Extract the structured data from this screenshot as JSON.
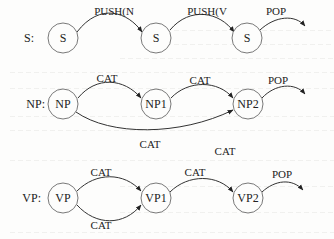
{
  "networks": [
    {
      "id": "S",
      "row_label": "S:",
      "nodes": [
        "S",
        "S",
        "S"
      ],
      "arcs": [
        {
          "from": 0,
          "to": 1,
          "label": "PUSH(N"
        },
        {
          "from": 1,
          "to": 2,
          "label": "PUSH(V"
        },
        {
          "from": 2,
          "to": "exit",
          "label": "POP"
        }
      ]
    },
    {
      "id": "NP",
      "row_label": "NP:",
      "nodes": [
        "NP",
        "NP1",
        "NP2"
      ],
      "arcs": [
        {
          "from": 0,
          "to": 1,
          "label": "CAT"
        },
        {
          "from": 1,
          "to": 2,
          "label": "CAT"
        },
        {
          "from": 2,
          "to": "exit",
          "label": "POP"
        },
        {
          "from": 0,
          "to": 2,
          "label": "CAT"
        }
      ],
      "extra_labels": [
        "CAT"
      ]
    },
    {
      "id": "VP",
      "row_label": "VP:",
      "nodes": [
        "VP",
        "VP1",
        "VP2"
      ],
      "arcs": [
        {
          "from": 0,
          "to": 1,
          "label": "CAT"
        },
        {
          "from": 0,
          "to": 1,
          "label": "CAT"
        },
        {
          "from": 1,
          "to": 2,
          "label": "CAT"
        },
        {
          "from": 2,
          "to": "exit",
          "label": "POP"
        }
      ]
    }
  ]
}
